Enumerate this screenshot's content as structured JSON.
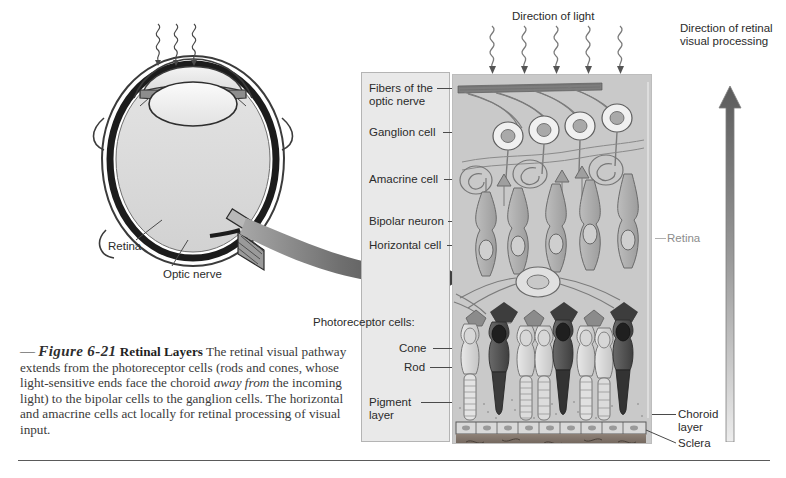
{
  "figure": {
    "dash": "—",
    "number": "Figure 6-21",
    "title": "Retinal Layers",
    "caption_part1": "The retinal visual pathway extends from the photoreceptor cells (rods and cones, whose light-sensitive ends face the choroid ",
    "caption_emphasis": "away from",
    "caption_part2": " the incoming light) to the bipolar cells to the ganglion cells. The horizontal and amacrine cells act locally for retinal processing of visual input."
  },
  "eye_diagram": {
    "labels": {
      "retina": "Retina",
      "optic_nerve": "Optic nerve"
    }
  },
  "panel": {
    "direction_of_light": "Direction of light",
    "direction_of_processing": "Direction of retinal\nvisual processing",
    "retina_side_label": "Retina"
  },
  "callouts": {
    "fibers_of_optic_nerve": "Fibers of the\noptic nerve",
    "ganglion_cell": "Ganglion cell",
    "amacrine_cell": "Amacrine cell",
    "bipolar_neuron": "Bipolar neuron",
    "horizontal_cell": "Horizontal cell",
    "photoreceptor_cells_header": "Photoreceptor cells:",
    "cone": "Cone",
    "rod": "Rod",
    "pigment_layer": "Pigment\nlayer",
    "choroid_layer": "Choroid\nlayer",
    "sclera": "Sclera"
  },
  "colors": {
    "panel_background": "#c9c9c9",
    "label_box_background": "#e9e9e9",
    "text": "#2b2b2b",
    "dim_text": "#8c8c8c",
    "arrow_dark": "#4c4c4c",
    "arrow_light": "#d9d9d9",
    "pigment_layer": "#7a6f68",
    "rule": "#5a5a5a"
  }
}
